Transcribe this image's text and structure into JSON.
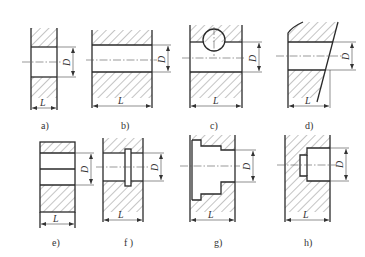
{
  "figure": {
    "dimension_labels": {
      "diameter": "D",
      "length": "L"
    },
    "panels": [
      {
        "id": "a",
        "caption": "a)"
      },
      {
        "id": "b",
        "caption": "b)"
      },
      {
        "id": "c",
        "caption": "c)"
      },
      {
        "id": "d",
        "caption": "d)"
      },
      {
        "id": "e",
        "caption": "e)"
      },
      {
        "id": "f",
        "caption": "f )"
      },
      {
        "id": "g",
        "caption": "g)"
      },
      {
        "id": "h",
        "caption": "h)"
      }
    ]
  },
  "colors": {
    "line": "#2a2a2a",
    "background": "#ffffff"
  }
}
